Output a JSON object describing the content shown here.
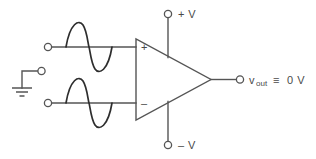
{
  "diagram": {
    "kind": "op-amp-schematic",
    "colors": {
      "wire": "#555555",
      "wave_fill": "#a8a8a8",
      "wave_stroke": "#2e2e2e",
      "text": "#4a4a4a",
      "background": "#ffffff"
    }
  },
  "labels": {
    "positive_rail": "+ V",
    "negative_rail": "– V",
    "noninverting_input_sign": "+",
    "inverting_input_sign": "–",
    "output_symbol": "v",
    "output_subscript": "out",
    "output_relation": "≡",
    "output_value": "0 V",
    "output_full": "v out ≡ 0 V"
  },
  "signals": {
    "top_input": {
      "name": "top-sine-wave",
      "cycles": 1,
      "phase": "positive-first",
      "filled": true
    },
    "bottom_input": {
      "name": "bottom-sine-wave",
      "cycles": 1,
      "phase": "positive-first",
      "filled": true
    }
  },
  "terminals": {
    "ground": "ground-symbol",
    "top_input_terminal": "top-input-terminal",
    "bottom_input_terminal": "bottom-input-terminal",
    "ground_terminal": "ground-terminal",
    "positive_rail_terminal": "positive-rail-terminal",
    "negative_rail_terminal": "negative-rail-terminal",
    "output_terminal": "output-terminal"
  }
}
